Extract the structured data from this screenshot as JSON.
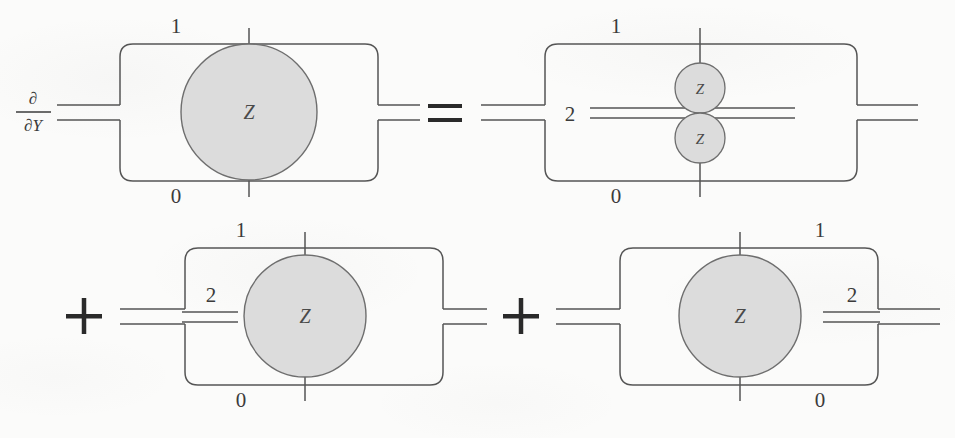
{
  "figure": {
    "background_color": "#fbfbfa",
    "wire_color": "#555555",
    "node_fill": "#dcdcdc",
    "node_stroke": "#6e6e6e",
    "text_color": "#3b3b3b",
    "operator_color": "#2a2a2a"
  },
  "operators": {
    "derivative_numerator": "∂",
    "derivative_denominator": "∂Y",
    "equals": "=",
    "plus_first": "+",
    "plus_second": "+"
  },
  "terms": [
    {
      "id": "lhs",
      "name": "left-hand-side",
      "row": "top",
      "prefix_operator": "derivative",
      "box_labels": {
        "top": "1",
        "bottom": "0"
      },
      "edge_label": null,
      "nodes": [
        {
          "label": "Z",
          "size": "large",
          "position": "center"
        }
      ]
    },
    {
      "id": "rhs-term-1",
      "name": "first-right-hand-term",
      "row": "top",
      "prefix_operator": "equals",
      "box_labels": {
        "top": "1",
        "bottom": "0"
      },
      "edge_label": "2",
      "edge_label_position": "inside-left",
      "nodes": [
        {
          "label": "Z",
          "size": "small",
          "position": "upper"
        },
        {
          "label": "Z",
          "size": "small",
          "position": "lower"
        }
      ]
    },
    {
      "id": "rhs-term-2",
      "name": "second-right-hand-term",
      "row": "bottom",
      "prefix_operator": "plus",
      "box_labels": {
        "top": "1",
        "bottom": "0"
      },
      "edge_label": "2",
      "edge_label_position": "left-of-node",
      "nodes": [
        {
          "label": "Z",
          "size": "large",
          "position": "center"
        }
      ]
    },
    {
      "id": "rhs-term-3",
      "name": "third-right-hand-term",
      "row": "bottom",
      "prefix_operator": "plus",
      "box_labels": {
        "top": "1",
        "bottom": "0"
      },
      "edge_label": "2",
      "edge_label_position": "right-of-node",
      "nodes": [
        {
          "label": "Z",
          "size": "large",
          "position": "center"
        }
      ]
    }
  ]
}
